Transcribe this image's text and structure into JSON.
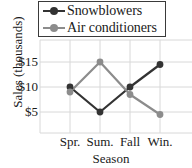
{
  "chart_data": {
    "type": "line",
    "title": "",
    "subtitle": "",
    "xlabel": "Season",
    "ylabel": "Sales (thousands)",
    "categories": [
      "Spr.",
      "Sum.",
      "Fall",
      "Win."
    ],
    "series": [
      {
        "name": "Snowblowers",
        "color": "#333333",
        "marker": "circle",
        "values": [
          10,
          5,
          10,
          14.5
        ]
      },
      {
        "name": "Air conditioners",
        "color": "#8c8c8c",
        "marker": "circle",
        "values": [
          9,
          15,
          8.5,
          4.5
        ]
      }
    ],
    "ytick_labels": [
      "$15",
      "$10",
      "$5"
    ],
    "ytick_values": [
      15,
      10,
      5
    ],
    "ylim": [
      0,
      20
    ],
    "xlim": [
      0,
      5
    ],
    "grid": true,
    "grid_color": "#d8d8d8",
    "legend_position": "top",
    "plot_background": "#ffffff"
  },
  "legend": {
    "entries": [
      {
        "label": "Snowblowers",
        "color": "#333333"
      },
      {
        "label": "Air conditioners",
        "color": "#8c8c8c"
      }
    ]
  },
  "axes": {
    "y_title": "Sales (thousands)",
    "x_title": "Season",
    "y_ticks": [
      "$15",
      "$10",
      "$5"
    ],
    "x_ticks": [
      "Spr.",
      "Sum.",
      "Fall",
      "Win."
    ]
  }
}
